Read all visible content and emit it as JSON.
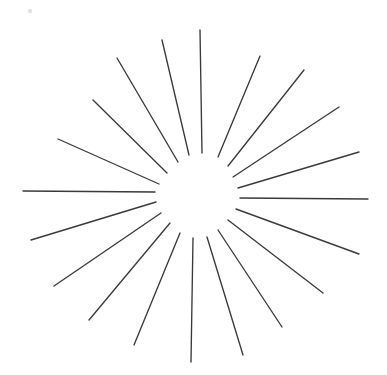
{
  "figure": {
    "type": "line-drawing",
    "width": 387,
    "height": 375,
    "background_color": "#ffffff",
    "stroke_color": "#3a3a3a",
    "stroke_width": 1.35,
    "center": {
      "x": 197,
      "y": 195
    },
    "ray_count": 20,
    "inner_radius_nominal": 42,
    "outer_radius_nominal": 172,
    "speck": {
      "x": 30,
      "y": 11,
      "r": 2.2,
      "color": "#e2e2e6"
    }
  },
  "rays": [
    {
      "name": "ray-right",
      "angle_deg": 1,
      "x1": 240,
      "y1": 198,
      "x2": 368,
      "y2": 199
    },
    {
      "name": "ray-right-up-1",
      "angle_deg": -16,
      "x1": 238,
      "y1": 188,
      "x2": 359,
      "y2": 152
    },
    {
      "name": "ray-right-up-2",
      "angle_deg": -33,
      "x1": 233,
      "y1": 177,
      "x2": 339,
      "y2": 107
    },
    {
      "name": "ray-right-up-3",
      "angle_deg": -49,
      "x1": 228,
      "y1": 166,
      "x2": 304,
      "y2": 70
    },
    {
      "name": "ray-right-up-4",
      "angle_deg": -66,
      "x1": 218,
      "y1": 157,
      "x2": 260,
      "y2": 56
    },
    {
      "name": "ray-up",
      "angle_deg": -88,
      "x1": 202,
      "y1": 153,
      "x2": 200,
      "y2": 30
    },
    {
      "name": "ray-left-up-4",
      "angle_deg": -104,
      "x1": 189,
      "y1": 155,
      "x2": 162,
      "y2": 40
    },
    {
      "name": "ray-left-up-3",
      "angle_deg": -122,
      "x1": 178,
      "y1": 162,
      "x2": 117,
      "y2": 58
    },
    {
      "name": "ray-left-up-2",
      "angle_deg": -140,
      "x1": 167,
      "y1": 173,
      "x2": 93,
      "y2": 100
    },
    {
      "name": "ray-left-up-1",
      "angle_deg": -160,
      "x1": 159,
      "y1": 184,
      "x2": 58,
      "y2": 139
    },
    {
      "name": "ray-left",
      "angle_deg": 179,
      "x1": 155,
      "y1": 192,
      "x2": 23,
      "y2": 191
    },
    {
      "name": "ray-left-down-1",
      "angle_deg": 160,
      "x1": 156,
      "y1": 202,
      "x2": 31,
      "y2": 240
    },
    {
      "name": "ray-left-down-2",
      "angle_deg": 143,
      "x1": 161,
      "y1": 213,
      "x2": 54,
      "y2": 286
    },
    {
      "name": "ray-left-down-3",
      "angle_deg": 126,
      "x1": 170,
      "y1": 223,
      "x2": 89,
      "y2": 320
    },
    {
      "name": "ray-left-down-4",
      "angle_deg": 108,
      "x1": 180,
      "y1": 233,
      "x2": 134,
      "y2": 345
    },
    {
      "name": "ray-down",
      "angle_deg": 91,
      "x1": 193,
      "y1": 238,
      "x2": 191,
      "y2": 362
    },
    {
      "name": "ray-right-down-4",
      "angle_deg": 73,
      "x1": 207,
      "y1": 237,
      "x2": 243,
      "y2": 355
    },
    {
      "name": "ray-right-down-3",
      "angle_deg": 56,
      "x1": 218,
      "y1": 230,
      "x2": 282,
      "y2": 327
    },
    {
      "name": "ray-right-down-2",
      "angle_deg": 38,
      "x1": 228,
      "y1": 220,
      "x2": 323,
      "y2": 293
    },
    {
      "name": "ray-right-down-1",
      "angle_deg": 20,
      "x1": 236,
      "y1": 209,
      "x2": 359,
      "y2": 254
    }
  ]
}
